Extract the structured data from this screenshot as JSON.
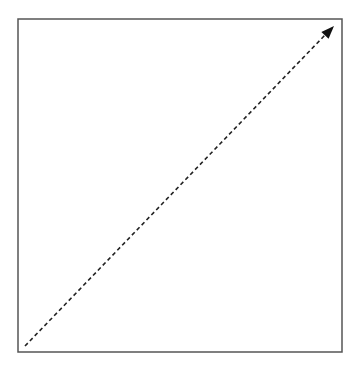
{
  "diagram": {
    "type": "arrow-in-box",
    "background": "#ffffff",
    "frame": {
      "x": 18,
      "y": 19,
      "width": 324,
      "height": 333,
      "stroke": "#555555",
      "stroke_width": 1.5
    },
    "arrow": {
      "x1": 25,
      "y1": 346,
      "x2": 326,
      "y2": 34,
      "tip": {
        "x": 334,
        "y": 26
      },
      "stroke": "#222222",
      "stroke_width": 1.6,
      "dash": "4 3",
      "head_color": "#111111",
      "style": "dashed"
    }
  }
}
